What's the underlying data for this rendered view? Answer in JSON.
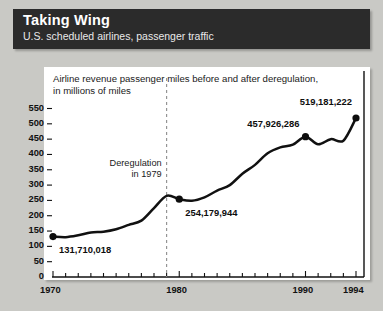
{
  "header": {
    "title": "Taking Wing",
    "subtitle": "U.S. scheduled airlines, passenger traffic"
  },
  "chart_caption": {
    "line1": "Airline revenue passenger miles before and after deregulation,",
    "line2": "in millions of miles"
  },
  "annotation": {
    "line1": "Deregulation",
    "line2": "in 1979",
    "year": 1979
  },
  "colors": {
    "page_background": "#c9c9c5",
    "header_background": "#2b2b2b",
    "header_text": "#ffffff",
    "panel_background": "#ffffff",
    "line": "#111111",
    "marker": "#0d0d0d",
    "axis": "#111111",
    "dashed_guide": "#8c8c8c"
  },
  "chart_data": {
    "type": "line",
    "title": "Airline revenue passenger miles before and after deregulation, in millions of miles",
    "xlabel": "",
    "ylabel": "",
    "xlim": [
      1970,
      1994
    ],
    "ylim": [
      0,
      550
    ],
    "ytick_labels": [
      "0",
      "50",
      "100",
      "150",
      "200",
      "250",
      "300",
      "350",
      "400",
      "450",
      "500",
      "550"
    ],
    "yticks": [
      0,
      50,
      100,
      150,
      200,
      250,
      300,
      350,
      400,
      450,
      500,
      550
    ],
    "xtick_labels": [
      "1970",
      "1980",
      "1990",
      "1994"
    ],
    "xticks": [
      1970,
      1980,
      1990,
      1994
    ],
    "xtick_minor_interval": 1,
    "grid": false,
    "legend": false,
    "x": [
      1970,
      1971,
      1972,
      1973,
      1974,
      1975,
      1976,
      1977,
      1978,
      1979,
      1980,
      1981,
      1982,
      1983,
      1984,
      1985,
      1986,
      1987,
      1988,
      1989,
      1990,
      1991,
      1992,
      1993,
      1994
    ],
    "values": [
      132,
      130,
      136,
      145,
      148,
      156,
      170,
      184,
      225,
      265,
      254,
      249,
      260,
      282,
      300,
      337,
      366,
      404,
      423,
      432,
      458,
      433,
      450,
      445,
      519
    ],
    "markers": [
      {
        "year": 1970,
        "value": 132,
        "label": "131,710,018"
      },
      {
        "year": 1980,
        "value": 254,
        "label": "254,179,944"
      },
      {
        "year": 1990,
        "value": 458,
        "label": "457,926,286"
      },
      {
        "year": 1994,
        "value": 519,
        "label": "519,181,222"
      }
    ],
    "annotations": [
      {
        "text": "Deregulation in 1979",
        "x": 1979,
        "type": "vertical-dashed-line"
      }
    ]
  }
}
